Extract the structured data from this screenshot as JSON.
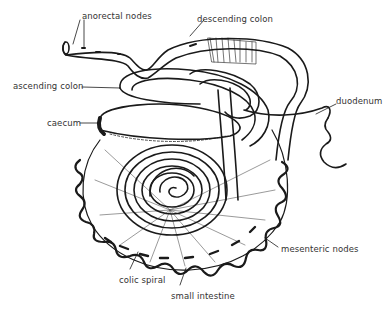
{
  "diagram": {
    "labels": [
      {
        "id": "anorectal-nodes",
        "text": "anorectal nodes",
        "x": 82,
        "y": 11
      },
      {
        "id": "descending-colon",
        "text": "descending colon",
        "x": 197,
        "y": 14
      },
      {
        "id": "ascending-colon",
        "text": "ascending colon",
        "x": 13,
        "y": 81
      },
      {
        "id": "caecum",
        "text": "caecum",
        "x": 47,
        "y": 118
      },
      {
        "id": "duodenum",
        "text": "duodenum",
        "x": 336,
        "y": 100
      },
      {
        "id": "mesenteric-nodes",
        "text": "mesenteric nodes",
        "x": 281,
        "y": 244
      },
      {
        "id": "colic-spiral",
        "text": "colic spiral",
        "x": 119,
        "y": 275
      },
      {
        "id": "small-intestine",
        "text": "small intestine",
        "x": 171,
        "y": 291
      }
    ]
  },
  "colors": {
    "ink": "#1a1a1a",
    "label": "#333333",
    "background": "#ffffff"
  }
}
